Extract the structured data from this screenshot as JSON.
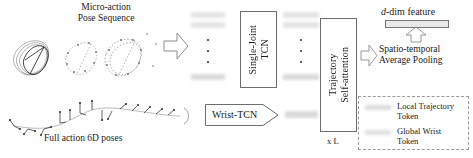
{
  "figure": {
    "title_left": "Micro-action\nPose Sequence",
    "label_bottom_left": "Full action 6D poses"
  },
  "modules": {
    "single_joint_tcn": "Single-Joint\nTCN",
    "trajectory_self_attention": "Trajectory\nSelf-attention",
    "wrist_tcn": "Wrist-TCN",
    "repeat_label": "x L",
    "pooling": "Spatio-temporal\nAverage Pooling",
    "output_feature": "d-dim feature",
    "output_feature_italic_prefix": "d",
    "output_feature_rest": "-dim feature"
  },
  "legend": {
    "items": [
      {
        "label": "Local Trajectory\nToken",
        "color": "#d2d2d2"
      },
      {
        "label": "Global Wrist\nToken",
        "color": "#d8d8d8"
      }
    ]
  },
  "colors": {
    "stroke": "#6e6e6e",
    "token_fill": "#dcdcdc",
    "text": "#191919",
    "legend_border": "#9a9a9a"
  },
  "dots": {
    "glyph": "·",
    "count": 3
  }
}
